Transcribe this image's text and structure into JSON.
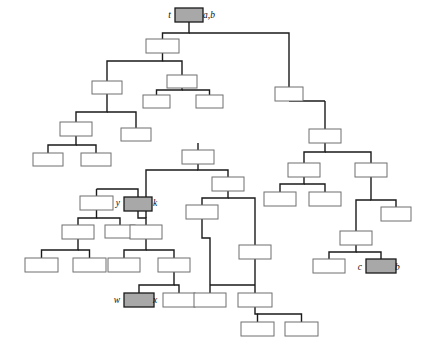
{
  "figure": {
    "title_fragment": "",
    "type": "tree-diagram",
    "width": 421,
    "height": 345,
    "background_color": "#ffffff",
    "node_fill": "#ffffff",
    "node_stroke": "#6f6f6f",
    "shaded_fill": "#a8a8a8",
    "edge_color": "#1a1a1a"
  },
  "labels": [
    {
      "id": "label-t",
      "text": "t",
      "x": 171,
      "y": 18,
      "side": "left"
    },
    {
      "id": "label-ab",
      "text": "a,b",
      "x": 203,
      "y": 18,
      "side": "right"
    },
    {
      "id": "label-y",
      "text": "y",
      "x": 120,
      "y": 206,
      "side": "left"
    },
    {
      "id": "label-k",
      "text": "k",
      "x": 153,
      "y": 206,
      "side": "right"
    },
    {
      "id": "label-w",
      "text": "w",
      "x": 120,
      "y": 303,
      "side": "left"
    },
    {
      "id": "label-x",
      "text": "x",
      "x": 153,
      "y": 303,
      "side": "right"
    },
    {
      "id": "label-c",
      "text": "c",
      "x": 362,
      "y": 270,
      "side": "left"
    },
    {
      "id": "label-b",
      "text": "b",
      "x": 395,
      "y": 270,
      "side": "right"
    }
  ],
  "nodes": [
    {
      "id": "n-root",
      "x": 175,
      "y": 8,
      "w": 28,
      "h": 14,
      "shaded": true,
      "thick": true
    },
    {
      "id": "n-a1",
      "x": 146,
      "y": 39,
      "w": 33,
      "h": 14,
      "shaded": false,
      "thick": false
    },
    {
      "id": "n-a2",
      "x": 275,
      "y": 87,
      "w": 28,
      "h": 14,
      "shaded": false,
      "thick": false
    },
    {
      "id": "n-b1",
      "x": 92,
      "y": 81,
      "w": 30,
      "h": 13,
      "shaded": false,
      "thick": false
    },
    {
      "id": "n-b2",
      "x": 167,
      "y": 75,
      "w": 30,
      "h": 13,
      "shaded": false,
      "thick": false
    },
    {
      "id": "n-b3",
      "x": 143,
      "y": 95,
      "w": 27,
      "h": 13,
      "shaded": false,
      "thick": false
    },
    {
      "id": "n-b4",
      "x": 196,
      "y": 95,
      "w": 27,
      "h": 13,
      "shaded": false,
      "thick": false
    },
    {
      "id": "n-c1",
      "x": 60,
      "y": 122,
      "w": 32,
      "h": 14,
      "shaded": false,
      "thick": false
    },
    {
      "id": "n-c2",
      "x": 121,
      "y": 128,
      "w": 30,
      "h": 13,
      "shaded": false,
      "thick": false
    },
    {
      "id": "n-c3",
      "x": 33,
      "y": 153,
      "w": 30,
      "h": 13,
      "shaded": false,
      "thick": false
    },
    {
      "id": "n-c4",
      "x": 81,
      "y": 153,
      "w": 30,
      "h": 13,
      "shaded": false,
      "thick": false
    },
    {
      "id": "n-d1",
      "x": 80,
      "y": 196,
      "w": 33,
      "h": 14,
      "shaded": false,
      "thick": false
    },
    {
      "id": "n-d2",
      "x": 124,
      "y": 197,
      "w": 28,
      "h": 14,
      "shaded": true,
      "thick": true
    },
    {
      "id": "n-d3",
      "x": 62,
      "y": 225,
      "w": 32,
      "h": 14,
      "shaded": false,
      "thick": false
    },
    {
      "id": "n-d4",
      "x": 105,
      "y": 225,
      "w": 30,
      "h": 13,
      "shaded": false,
      "thick": false
    },
    {
      "id": "n-d5",
      "x": 25,
      "y": 258,
      "w": 33,
      "h": 14,
      "shaded": false,
      "thick": false
    },
    {
      "id": "n-d6",
      "x": 73,
      "y": 258,
      "w": 33,
      "h": 14,
      "shaded": false,
      "thick": false
    },
    {
      "id": "n-e1",
      "x": 130,
      "y": 225,
      "w": 32,
      "h": 14,
      "shaded": false,
      "thick": false
    },
    {
      "id": "n-e2",
      "x": 108,
      "y": 258,
      "w": 32,
      "h": 14,
      "shaded": false,
      "thick": false
    },
    {
      "id": "n-e3",
      "x": 158,
      "y": 258,
      "w": 32,
      "h": 14,
      "shaded": false,
      "thick": false
    },
    {
      "id": "n-e4",
      "x": 124,
      "y": 293,
      "w": 30,
      "h": 14,
      "shaded": true,
      "thick": true
    },
    {
      "id": "n-e5",
      "x": 163,
      "y": 293,
      "w": 32,
      "h": 14,
      "shaded": false,
      "thick": false
    },
    {
      "id": "n-f1",
      "x": 182,
      "y": 150,
      "w": 32,
      "h": 14,
      "shaded": false,
      "thick": false
    },
    {
      "id": "n-f2",
      "x": 212,
      "y": 177,
      "w": 32,
      "h": 14,
      "shaded": false,
      "thick": false
    },
    {
      "id": "n-f3",
      "x": 186,
      "y": 205,
      "w": 32,
      "h": 14,
      "shaded": false,
      "thick": false
    },
    {
      "id": "n-f4",
      "x": 239,
      "y": 245,
      "w": 32,
      "h": 14,
      "shaded": false,
      "thick": false
    },
    {
      "id": "n-f5",
      "x": 194,
      "y": 293,
      "w": 32,
      "h": 14,
      "shaded": false,
      "thick": false
    },
    {
      "id": "n-f6",
      "x": 238,
      "y": 293,
      "w": 34,
      "h": 14,
      "shaded": false,
      "thick": false
    },
    {
      "id": "n-f7",
      "x": 241,
      "y": 322,
      "w": 33,
      "h": 14,
      "shaded": false,
      "thick": false
    },
    {
      "id": "n-f8",
      "x": 285,
      "y": 322,
      "w": 33,
      "h": 14,
      "shaded": false,
      "thick": false
    },
    {
      "id": "n-g1",
      "x": 309,
      "y": 129,
      "w": 32,
      "h": 14,
      "shaded": false,
      "thick": false
    },
    {
      "id": "n-g2",
      "x": 288,
      "y": 163,
      "w": 32,
      "h": 14,
      "shaded": false,
      "thick": false
    },
    {
      "id": "n-g3",
      "x": 264,
      "y": 192,
      "w": 32,
      "h": 14,
      "shaded": false,
      "thick": false
    },
    {
      "id": "n-g4",
      "x": 309,
      "y": 192,
      "w": 32,
      "h": 14,
      "shaded": false,
      "thick": false
    },
    {
      "id": "n-g5",
      "x": 355,
      "y": 163,
      "w": 32,
      "h": 14,
      "shaded": false,
      "thick": false
    },
    {
      "id": "n-g6",
      "x": 381,
      "y": 207,
      "w": 30,
      "h": 14,
      "shaded": false,
      "thick": false
    },
    {
      "id": "n-g7",
      "x": 340,
      "y": 231,
      "w": 32,
      "h": 14,
      "shaded": false,
      "thick": false
    },
    {
      "id": "n-g8",
      "x": 313,
      "y": 259,
      "w": 32,
      "h": 14,
      "shaded": false,
      "thick": false
    },
    {
      "id": "n-g9",
      "x": 366,
      "y": 259,
      "w": 30,
      "h": 14,
      "shaded": true,
      "thick": true
    }
  ],
  "edges": [
    {
      "id": "e-root-bus",
      "d": "M 189 22 L 189 33 L 162.5 33 L 162.5 39"
    },
    {
      "id": "e-root-right",
      "d": "M 189 33 L 289 33 L 289 87"
    },
    {
      "id": "e-a1-down",
      "d": "M 162.5 53 L 162.5 61 L 107 61 L 107 81"
    },
    {
      "id": "e-a1-right",
      "d": "M 162.5 61 L 182 61 L 182 75"
    },
    {
      "id": "e-b2-down",
      "d": "M 182 88 L 182 90 L 156.5 90 L 156.5 95"
    },
    {
      "id": "e-b2-r",
      "d": "M 182 90 L 209.5 90 L 209.5 95"
    },
    {
      "id": "e-b1-down",
      "d": "M 107 94 L 107 112 L 76 112 L 76 122"
    },
    {
      "id": "e-b1-r",
      "d": "M 107 112 L 136 112 L 136 128"
    },
    {
      "id": "e-c1-down",
      "d": "M 76 136 L 76 145 L 48 145 L 48 153"
    },
    {
      "id": "e-c1-r",
      "d": "M 76 145 L 96 145 L 96 153"
    },
    {
      "id": "e-dparent",
      "d": "M 96.5 189 L 96.5 196"
    },
    {
      "id": "e-dbus",
      "d": "M 96.5 189 L 138 189 L 138 197"
    },
    {
      "id": "e-d1-down",
      "d": "M 96.5 210 L 96.5 218 L 78 218 L 78 225"
    },
    {
      "id": "e-d1-r",
      "d": "M 96.5 218 L 120 218 L 120 225"
    },
    {
      "id": "e-d3-down",
      "d": "M 78 239 L 78 250 L 41.5 250 L 41.5 258"
    },
    {
      "id": "e-d3-r",
      "d": "M 78 250 L 89.5 250 L 89.5 258"
    },
    {
      "id": "e-k-stem",
      "d": "M 138 211 L 138 218 L 146 218 L 146 225"
    },
    {
      "id": "e-k-bus",
      "d": "M 146 211 L 146 218"
    },
    {
      "id": "e-e1-down",
      "d": "M 146 239 L 146 250 L 124 250 L 124 258"
    },
    {
      "id": "e-e1-r",
      "d": "M 146 250 L 174 250 L 174 258"
    },
    {
      "id": "e-e3-down",
      "d": "M 174 272 L 174 285 L 139 285 L 139 293"
    },
    {
      "id": "e-e3-r",
      "d": "M 174 285 L 179 285 L 179 293"
    },
    {
      "id": "e-f1-up",
      "d": "M 198 143 L 198 150"
    },
    {
      "id": "e-f1-down",
      "d": "M 198 164 L 198 170 L 228 170 L 228 177"
    },
    {
      "id": "e-f1-left",
      "d": "M 198 170 L 146 170 L 146 197"
    },
    {
      "id": "e-f2-down",
      "d": "M 228 191 L 228 198 L 202 198 L 202 205"
    },
    {
      "id": "e-f2-r",
      "d": "M 228 198 L 255 198 L 255 245"
    },
    {
      "id": "e-f3-down",
      "d": "M 202 219 L 202 238 L 210 238 L 210 293"
    },
    {
      "id": "e-f4-down",
      "d": "M 255 259 L 255 285 L 255 285"
    },
    {
      "id": "e-f4-bus",
      "d": "M 255 285 L 210 285 M 255 285 L 255 293"
    },
    {
      "id": "e-f6-down",
      "d": "M 255 307 L 255 314 L 257.5 314 L 257.5 322"
    },
    {
      "id": "e-f6-r",
      "d": "M 257.5 314 L 301.5 314 L 301.5 322"
    },
    {
      "id": "e-g1-up",
      "d": "M 325 101 L 325 129"
    },
    {
      "id": "e-g1-left",
      "d": "M 289 101 L 325 101"
    },
    {
      "id": "e-g1-down",
      "d": "M 325 143 L 325 152 L 304 152 L 304 163"
    },
    {
      "id": "e-g1-r",
      "d": "M 325 152 L 371 152 L 371 163"
    },
    {
      "id": "e-g2-down",
      "d": "M 304 177 L 304 184 L 280 184 L 280 192"
    },
    {
      "id": "e-g2-r",
      "d": "M 304 184 L 325 184 L 325 192"
    },
    {
      "id": "e-g5-down",
      "d": "M 371 177 L 371 200 L 396 200 L 396 207"
    },
    {
      "id": "e-g5-l",
      "d": "M 371 200 L 356 200 L 356 231"
    },
    {
      "id": "e-g7-down",
      "d": "M 356 245 L 356 252 L 329 252 L 329 259"
    },
    {
      "id": "e-g7-r",
      "d": "M 356 252 L 381 252 L 381 259"
    }
  ]
}
